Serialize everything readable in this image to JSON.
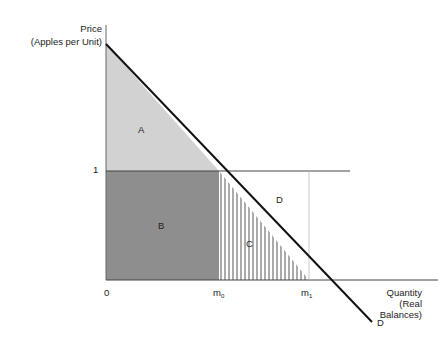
{
  "diagram": {
    "y_axis": {
      "label_line1": "Price",
      "label_line2": "(Apples per Unit)",
      "tick_1": "1"
    },
    "x_axis": {
      "label_line1": "Quantity",
      "label_line2": "(Real",
      "label_line3": "Balances)",
      "tick_0": "0",
      "tick_m0_base": "m",
      "tick_m0_sub": "0",
      "tick_m1_base": "m",
      "tick_m1_sub": "1"
    },
    "curve_label": "D",
    "regions": {
      "a": "A",
      "b": "B",
      "c": "C",
      "d": "D"
    },
    "colors": {
      "region_a": "#d2d2d2",
      "region_b": "#8e8e8e",
      "hatch": "#555555",
      "line": "#111111",
      "axis": "#444444"
    }
  }
}
